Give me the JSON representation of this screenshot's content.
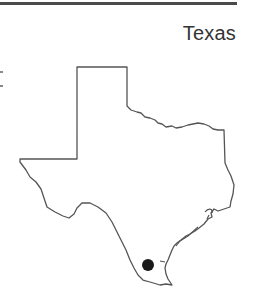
{
  "header": {
    "title": "Texas"
  },
  "map": {
    "region": "Texas",
    "outline_color": "#555555",
    "marker": {
      "label": "location-dot",
      "color": "#1a1a1a",
      "cx": 148,
      "cy": 265,
      "r": 6
    }
  }
}
